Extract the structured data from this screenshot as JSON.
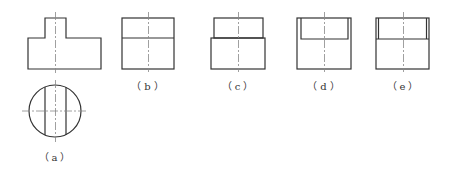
{
  "figures": [
    {
      "id": "a",
      "label": "（a）",
      "description": "Front view of stepped cylinder (T-shape) with top view circle showing two vertical cut lines"
    },
    {
      "id": "b",
      "label": "（b）",
      "description": "Rectangle divided by horizontal line"
    },
    {
      "id": "c",
      "label": "（c）",
      "description": "Stepped rectangle: narrower top on wider base"
    },
    {
      "id": "d",
      "label": "（d）",
      "description": "Rectangle with inset inner rectangle at top"
    },
    {
      "id": "e",
      "label": "（e）",
      "description": "Rectangle with narrow side strips at top section"
    }
  ],
  "colors": {
    "stroke": "#333333",
    "centerline": "#888888",
    "background": "#ffffff"
  }
}
